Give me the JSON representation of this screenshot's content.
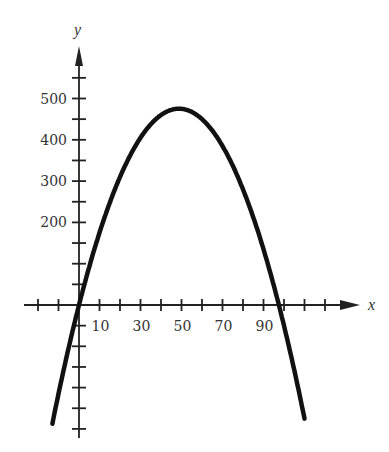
{
  "chart_data": {
    "type": "line",
    "title": "",
    "xlabel": "x",
    "ylabel": "y",
    "equation_shape": "downward parabola, roots near x=0 and x=100, vertex (50, 500)",
    "x_ticks_labeled": [
      10,
      30,
      50,
      70,
      90
    ],
    "x_tick_labels": [
      "10",
      "30",
      "50",
      "70",
      "90"
    ],
    "y_ticks_labeled": [
      200,
      300,
      400,
      500
    ],
    "y_tick_labels": [
      "200",
      "300",
      "400",
      "500"
    ],
    "x_tick_step": 10,
    "y_tick_step": 50,
    "xlim": [
      -20,
      130
    ],
    "ylim": [
      -330,
      600
    ],
    "grid": false,
    "series": [
      {
        "name": "curve",
        "x": [
          -13,
          0,
          10,
          20,
          30,
          40,
          50,
          60,
          70,
          80,
          90,
          100,
          110
        ],
        "values": [
          -294,
          0,
          180,
          320,
          420,
          480,
          500,
          480,
          420,
          320,
          180,
          0,
          -220
        ]
      }
    ]
  },
  "labels": {
    "x_axis": "x",
    "y_axis": "y"
  },
  "colors": {
    "curve": "#111111",
    "axis": "#222222",
    "text": "#333333"
  }
}
